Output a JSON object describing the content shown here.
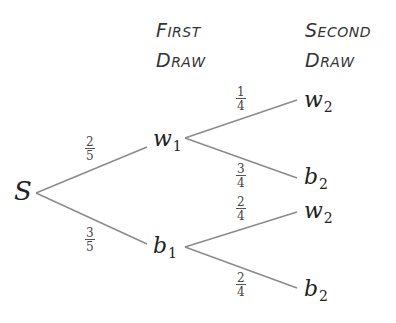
{
  "headers": {
    "first": {
      "line1_cap": "F",
      "line1_rest": "irst",
      "line2_cap": "D",
      "line2_rest": "raw",
      "full": "First Draw"
    },
    "second": {
      "line1_cap": "S",
      "line1_rest": "econd",
      "line2_cap": "D",
      "line2_rest": "raw",
      "full": "Second Draw"
    }
  },
  "root": {
    "label": "S"
  },
  "first_draw": [
    {
      "id": "w1",
      "letter": "w",
      "sub": "1",
      "prob_num": "2",
      "prob_den": "5"
    },
    {
      "id": "b1",
      "letter": "b",
      "sub": "1",
      "prob_num": "3",
      "prob_den": "5"
    }
  ],
  "second_draw": [
    {
      "parent": "w1",
      "letter": "w",
      "sub": "2",
      "prob_num": "1",
      "prob_den": "4"
    },
    {
      "parent": "w1",
      "letter": "b",
      "sub": "2",
      "prob_num": "3",
      "prob_den": "4"
    },
    {
      "parent": "b1",
      "letter": "w",
      "sub": "2",
      "prob_num": "2",
      "prob_den": "4"
    },
    {
      "parent": "b1",
      "letter": "b",
      "sub": "2",
      "prob_num": "2",
      "prob_den": "4"
    }
  ],
  "colors": {
    "line": "#8a8a8a",
    "text": "#222222",
    "background": "#ffffff"
  }
}
